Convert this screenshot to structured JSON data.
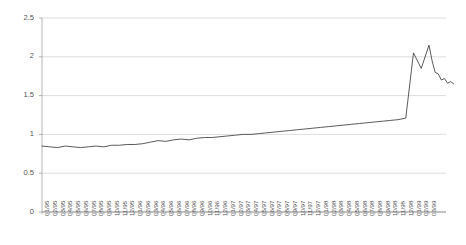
{
  "chart_data": {
    "type": "line",
    "title": "",
    "subtitle": "",
    "xlabel": "",
    "ylabel": "",
    "ylim": [
      0,
      2.5
    ],
    "yticks": [
      0,
      0.5,
      1,
      1.5,
      2,
      2.5
    ],
    "ytick_labels": [
      "0",
      "0.5",
      "1",
      "1.5",
      "2",
      "2.5"
    ],
    "grid": true,
    "grid_axis": "y",
    "legend": false,
    "legend_position": "none",
    "line_color": "#3f3f3f",
    "grid_color": "#c8c8c8",
    "axis_color": "#9a9a9a",
    "background_color": "#ffffff",
    "categories": [
      "01/95",
      "02/95",
      "03/95",
      "04/95",
      "05/95",
      "06/95",
      "07/95",
      "08/95",
      "09/95",
      "10/95",
      "11/95",
      "12/95",
      "01/96",
      "02/96",
      "03/96",
      "04/96",
      "05/96",
      "06/96",
      "07/96",
      "08/96",
      "09/96",
      "10/96",
      "11/96",
      "12/96",
      "01/97",
      "02/97",
      "03/97",
      "04/97",
      "05/97",
      "06/97",
      "07/97",
      "08/97",
      "09/97",
      "10/97",
      "11/97",
      "12/97",
      "01/98",
      "02/98",
      "03/98",
      "04/98",
      "05/98",
      "06/98",
      "07/98",
      "08/98",
      "09/98",
      "10/98",
      "11/98",
      "12/98",
      "01/99",
      "02/99",
      "03/99"
    ],
    "xtick_labels": [
      "01/95",
      "02/95",
      "03/95",
      "04/95",
      "05/95",
      "06/95",
      "07/95",
      "08/95",
      "09/95",
      "10/95",
      "11/95",
      "12/95",
      "01/96",
      "02/96",
      "03/96",
      "04/96",
      "05/96",
      "06/96",
      "07/96",
      "08/96",
      "09/96",
      "10/96",
      "11/96",
      "12/96",
      "01/97",
      "02/97",
      "03/97",
      "04/97",
      "05/97",
      "06/97",
      "07/97",
      "08/97",
      "09/97",
      "10/97",
      "11/97",
      "12/97",
      "01/98",
      "02/98",
      "03/98",
      "04/98",
      "05/98",
      "06/98",
      "07/98",
      "08/98",
      "09/98",
      "10/98",
      "11/98",
      "12/98",
      "01/99",
      "02/99",
      "03/99"
    ],
    "values": [
      0.85,
      0.84,
      0.83,
      0.85,
      0.84,
      0.83,
      0.84,
      0.85,
      0.84,
      0.86,
      0.86,
      0.87,
      0.87,
      0.88,
      0.9,
      0.92,
      0.91,
      0.93,
      0.94,
      0.93,
      0.95,
      0.96,
      0.96,
      0.97,
      0.98,
      0.99,
      1.0,
      1.0,
      1.01,
      1.02,
      1.03,
      1.04,
      1.05,
      1.06,
      1.07,
      1.08,
      1.09,
      1.1,
      1.11,
      1.12,
      1.13,
      1.14,
      1.15,
      1.16,
      1.17,
      1.18,
      1.19,
      1.21,
      2.05,
      1.85,
      2.15
    ],
    "series": [
      {
        "name": "series-1",
        "values": [
          0.85,
          0.84,
          0.83,
          0.85,
          0.84,
          0.83,
          0.84,
          0.85,
          0.84,
          0.86,
          0.86,
          0.87,
          0.87,
          0.88,
          0.9,
          0.92,
          0.91,
          0.93,
          0.94,
          0.93,
          0.95,
          0.96,
          0.96,
          0.97,
          0.98,
          0.99,
          1.0,
          1.0,
          1.01,
          1.02,
          1.03,
          1.04,
          1.05,
          1.06,
          1.07,
          1.08,
          1.09,
          1.1,
          1.11,
          1.12,
          1.13,
          1.14,
          1.15,
          1.16,
          1.17,
          1.18,
          1.19,
          1.21,
          2.05,
          1.85,
          2.15
        ]
      }
    ],
    "tail_points": [
      {
        "x_frac": 50.4,
        "value": 1.95
      },
      {
        "x_frac": 50.8,
        "value": 1.8
      },
      {
        "x_frac": 51.2,
        "value": 1.78
      },
      {
        "x_frac": 51.6,
        "value": 1.7
      },
      {
        "x_frac": 52.0,
        "value": 1.72
      },
      {
        "x_frac": 52.4,
        "value": 1.66
      },
      {
        "x_frac": 52.8,
        "value": 1.68
      },
      {
        "x_frac": 53.2,
        "value": 1.65
      }
    ]
  },
  "plot_geometry": {
    "left": 42,
    "right": 446,
    "top": 18,
    "bottom": 212
  }
}
